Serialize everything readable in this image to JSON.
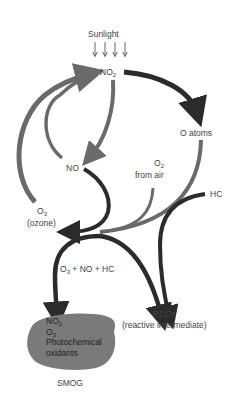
{
  "diagram": {
    "colors": {
      "dark_arrow": "#2b2b2b",
      "gray_arrow": "#6a6a6a",
      "smog_fill": "#7a7a7a",
      "text": "#444444",
      "background": "#ffffff"
    },
    "nodes": {
      "sunlight": "Sunlight",
      "no2": {
        "base": "NO",
        "sub": "2"
      },
      "o_atoms": "O atoms",
      "no": "NO",
      "o2": {
        "base": "O",
        "sub": "2"
      },
      "from_air": "from air",
      "o3": {
        "base": "O",
        "sub": "3"
      },
      "ozone": "(ozone)",
      "hc": "HC",
      "reaction": {
        "o3_base": "O",
        "o3_sub": "3",
        "rest": " + NO + HC"
      },
      "rco": "RCO•",
      "reactive_intermediate": "(reactive intermediate)",
      "smog_label": "SMOG"
    },
    "smog_contents": {
      "no2": {
        "base": "NO",
        "sub": "2"
      },
      "o3": {
        "base": "O",
        "sub": "3"
      },
      "line3": "Photochemical",
      "line4": "oxidants"
    },
    "edges": [
      {
        "from": "Sunlight",
        "to": "NO2",
        "label": "4 light arrows"
      },
      {
        "from": "NO2",
        "to": "O atoms"
      },
      {
        "from": "NO2",
        "to": "NO"
      },
      {
        "from": "NO",
        "to": "NO2"
      },
      {
        "from": "O3",
        "to": "NO2"
      },
      {
        "from": "NO",
        "to": "O3"
      },
      {
        "from": "O atoms",
        "to": "O3"
      },
      {
        "from": "O2 from air",
        "to": "O3"
      },
      {
        "from": "HC",
        "to": "RCO•"
      },
      {
        "from": "O3 + NO + HC",
        "to": "SMOG"
      },
      {
        "from": "O3 + NO + HC",
        "to": "RCO•"
      }
    ]
  }
}
